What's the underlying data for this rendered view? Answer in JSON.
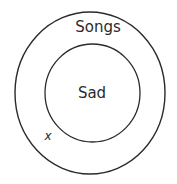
{
  "diagram": {
    "type": "venn-nested",
    "outer_set": {
      "label": "Songs"
    },
    "inner_set": {
      "label": "Sad"
    },
    "marker": {
      "label": "x",
      "position": "inside Songs, outside Sad"
    }
  },
  "colors": {
    "stroke": "#2a2a2a",
    "background": "#ffffff"
  }
}
